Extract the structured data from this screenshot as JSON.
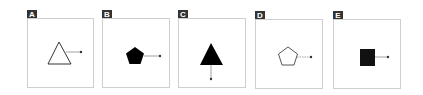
{
  "panels": [
    {
      "label": "A",
      "shape": "triangle",
      "fill": "outline",
      "pointer_direction": "right"
    },
    {
      "label": "B",
      "shape": "pentagon",
      "fill": "solid",
      "pointer_direction": "right"
    },
    {
      "label": "C",
      "shape": "triangle",
      "fill": "solid",
      "pointer_direction": "down"
    },
    {
      "label": "D",
      "shape": "pentagon",
      "fill": "outline",
      "pointer_direction": "right"
    },
    {
      "label": "E",
      "shape": "square",
      "fill": "solid",
      "pointer_direction": "right"
    }
  ],
  "colors": {
    "label_bg": "#333333",
    "label_text": "#ffffff",
    "frame_border": "#cfcfcf",
    "shape_stroke": "#333333",
    "shape_fill_solid": "#000000",
    "pointer_line": "#888888"
  }
}
